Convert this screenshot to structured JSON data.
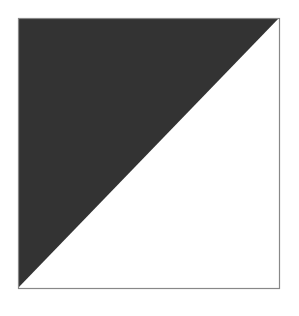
{
  "figure": {
    "shape": "square-split-diagonal",
    "square": {
      "x": 18,
      "y": 18,
      "width": 261,
      "height": 270
    },
    "dark_triangle": {
      "fill": "#333333",
      "points": "18,18 279,18 18,288"
    },
    "light_triangle": {
      "fill": "#ffffff",
      "points": "279,18 279,288 18,288"
    },
    "border_color": "#888888",
    "background": "#ffffff"
  }
}
